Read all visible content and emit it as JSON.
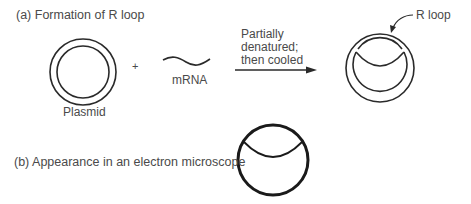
{
  "panel_a": {
    "title": "(a) Formation of R loop",
    "plasmid_label": "Plasmid",
    "plus": "+",
    "mrna_label": "mRNA",
    "step_text": [
      "Partially",
      "denatured;",
      "then cooled"
    ],
    "rloop_label": "R loop"
  },
  "panel_b": {
    "title": "(b) Appearance in an electron microscope"
  },
  "colors": {
    "stroke": "#2a2a2a",
    "text": "#4a4a4a"
  }
}
